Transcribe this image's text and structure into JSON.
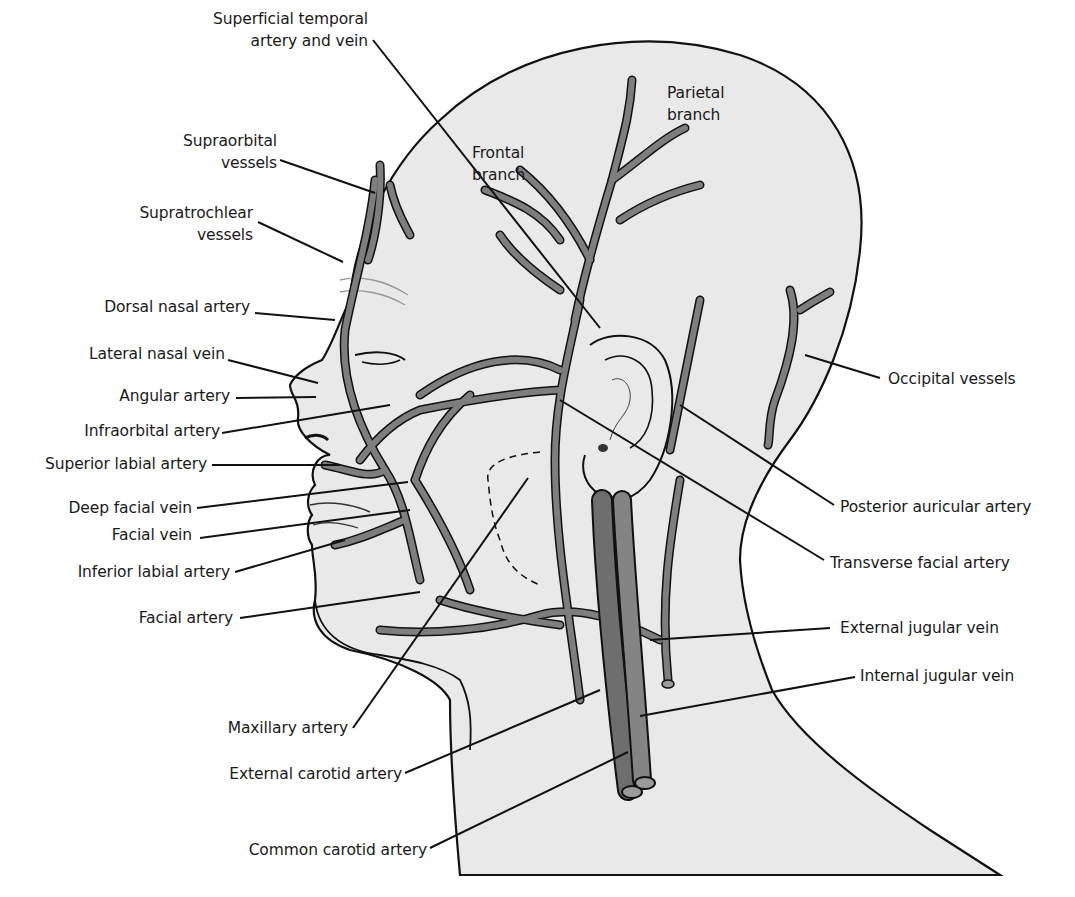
{
  "figure": {
    "colors": {
      "background": "#ffffff",
      "skin_fill": "#e9e9e9",
      "vessel_fill": "#7e7e7e",
      "vessel_dark": "#686868",
      "outline": "#111111",
      "leader_line": "#111111",
      "label_text": "#1a1a1a"
    }
  },
  "labels": {
    "superficial_temporal": {
      "line1": "Superficial temporal",
      "line2": "artery and vein"
    },
    "parietal_branch": {
      "line1": "Parietal",
      "line2": "branch"
    },
    "frontal_branch": {
      "line1": "Frontal",
      "line2": "branch"
    },
    "supraorbital": {
      "line1": "Supraorbital",
      "line2": "vessels"
    },
    "supratrochlear": {
      "line1": "Supratrochlear",
      "line2": "vessels"
    },
    "dorsal_nasal": "Dorsal nasal artery",
    "lateral_nasal": "Lateral nasal vein",
    "angular": "Angular artery",
    "infraorbital": "Infraorbital artery",
    "superior_labial": "Superior labial artery",
    "deep_facial_vein": "Deep facial vein",
    "facial_vein": "Facial vein",
    "inferior_labial": "Inferior labial artery",
    "facial_artery": "Facial artery",
    "maxillary": "Maxillary artery",
    "external_carotid": "External carotid artery",
    "common_carotid": "Common carotid artery",
    "occipital": "Occipital vessels",
    "posterior_auricular": "Posterior auricular artery",
    "transverse_facial": "Transverse facial artery",
    "external_jugular": "External jugular vein",
    "internal_jugular": "Internal jugular vein"
  }
}
